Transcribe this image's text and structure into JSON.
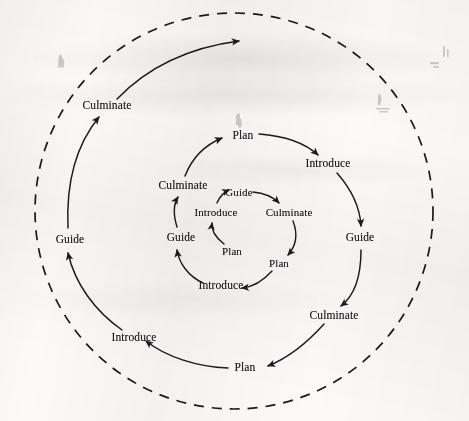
{
  "diagram": {
    "phases": [
      "Plan",
      "Introduce",
      "Guide",
      "Culminate"
    ],
    "stroke_color": "#1c1a1f",
    "background_color": "#fbfaf8",
    "outer_boundary": {
      "name": "dashed-outer-circle",
      "style": "dashed",
      "cx": 234,
      "cy": 211,
      "rx": 199,
      "ry": 198
    },
    "cycles": [
      {
        "name": "inner-cycle",
        "ring": 1,
        "labels": [
          {
            "text": "Plan",
            "x": 232,
            "y": 251
          },
          {
            "text": "Introduce",
            "x": 216,
            "y": 212
          },
          {
            "text": "Guide",
            "x": 239,
            "y": 192
          },
          {
            "text": "Culminate",
            "x": 289,
            "y": 212
          },
          {
            "text": "Plan",
            "x": 279,
            "y": 263
          }
        ]
      },
      {
        "name": "middle-cycle",
        "ring": 2,
        "labels": [
          {
            "text": "Introduce",
            "x": 221,
            "y": 286
          },
          {
            "text": "Guide",
            "x": 181,
            "y": 238
          },
          {
            "text": "Culminate",
            "x": 183,
            "y": 186
          },
          {
            "text": "Plan",
            "x": 243,
            "y": 136
          },
          {
            "text": "Introduce",
            "x": 328,
            "y": 164
          },
          {
            "text": "Guide",
            "x": 360,
            "y": 238
          },
          {
            "text": "Culminate",
            "x": 334,
            "y": 316
          },
          {
            "text": "Plan",
            "x": 245,
            "y": 368
          }
        ]
      },
      {
        "name": "outer-cycle",
        "ring": 3,
        "labels": [
          {
            "text": "Introduce",
            "x": 134,
            "y": 338
          },
          {
            "text": "Guide",
            "x": 70,
            "y": 240
          },
          {
            "text": "Culminate",
            "x": 107,
            "y": 106
          }
        ]
      }
    ],
    "arrowheads": [
      {
        "name": "outer-spiral-terminal-arrow",
        "x": 248,
        "y": 40
      }
    ]
  }
}
